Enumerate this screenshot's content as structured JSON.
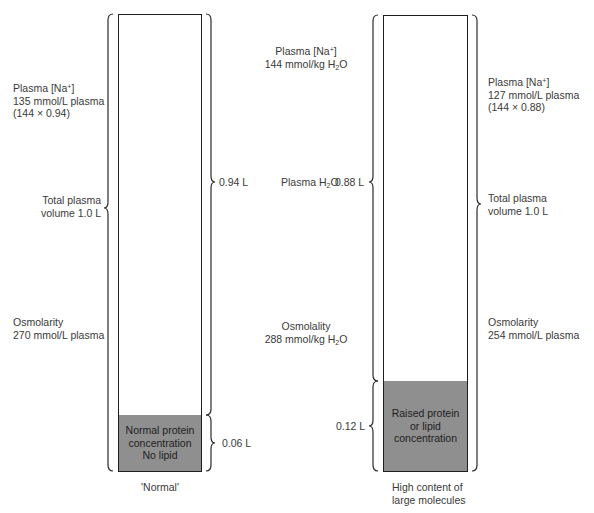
{
  "figure": {
    "type": "plasma sodium pseudohyponatraemia diagram",
    "fill_color": "#8f8f8f",
    "line_color": "#1e1e1e",
    "text_color": "#3a3a3a"
  },
  "center": {
    "sodium_label": "Plasma [Na+]",
    "sodium_value": "144 mmol/kg H2O",
    "water_label": "Plasma H2O",
    "osmolality_label": "Osmolality",
    "osmolality_value": "288 mmol/kg H2O"
  },
  "normal": {
    "caption": "'Normal'",
    "sodium_label": "Plasma [Na+]",
    "sodium_value": "135 mmol/L plasma",
    "sodium_calc": "(144 × 0.94)",
    "volume_label_line1": "Total plasma",
    "volume_label_line2": "volume 1.0 L",
    "osmolarity_label": "Osmolarity",
    "osmolarity_value": "270 mmol/L plasma",
    "water_volume": "0.94 L",
    "solids_volume": "0.06 L",
    "fill_text_line1": "Normal protein",
    "fill_text_line2": "concentration",
    "fill_text_line3": "No lipid",
    "water_fraction": 0.94,
    "solids_fraction": 0.06
  },
  "high": {
    "caption_line1": "High content of",
    "caption_line2": "large molecules",
    "sodium_label": "Plasma [Na+]",
    "sodium_value": "127 mmol/L plasma",
    "sodium_calc": "(144 × 0.88)",
    "volume_label_line1": "Total plasma",
    "volume_label_line2": "volume 1.0 L",
    "osmolarity_label": "Osmolarity",
    "osmolarity_value": "254 mmol/L plasma",
    "water_volume": "0.88 L",
    "solids_volume": "0.12 L",
    "fill_text_line1": "Raised protein",
    "fill_text_line2": "or lipid",
    "fill_text_line3": "concentration",
    "water_fraction": 0.88,
    "solids_fraction": 0.12
  }
}
